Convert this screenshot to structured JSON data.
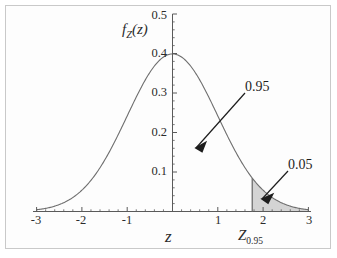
{
  "figure": {
    "background_color": "#ffffff",
    "frame_color": "#c9c9c9",
    "curve_color": "#6e6e6e",
    "axis_color": "#5a5a5a",
    "fill_color": "#d4d4d4",
    "annotation_color": "#1d1d1d"
  },
  "axes": {
    "y_axis_label": "f",
    "y_axis_label_sub": "Z",
    "y_axis_label_tail": "(z)",
    "x_axis_label": "z",
    "x_ticks": [
      "-3",
      "-2",
      "-1",
      "1",
      "2",
      "3"
    ],
    "x_tick_values": [
      -3,
      -2,
      -1,
      1,
      2,
      3
    ],
    "y_ticks": [
      "0.1",
      "0.2",
      "0.3",
      "0.4",
      "0.5"
    ],
    "y_tick_values": [
      0.1,
      0.2,
      0.3,
      0.4,
      0.5
    ]
  },
  "annotations": {
    "area_main_label": "0.95",
    "area_tail_label": "0.05",
    "critical_value_label": "Z",
    "critical_value_sub": "0.95"
  },
  "chart_data": {
    "type": "area",
    "title": "",
    "xlabel": "z",
    "ylabel": "f_Z(z)",
    "grid": false,
    "legend_position": "none",
    "xlim": [
      -3,
      3
    ],
    "ylim": [
      0,
      0.5
    ],
    "x_ticks": [
      -3,
      -2,
      -1,
      1,
      2,
      3
    ],
    "y_ticks": [
      0.1,
      0.2,
      0.3,
      0.4,
      0.5
    ],
    "series": [
      {
        "name": "standard normal pdf",
        "type": "line",
        "x": [
          -3.0,
          -2.8,
          -2.6,
          -2.4,
          -2.2,
          -2.0,
          -1.8,
          -1.6,
          -1.4,
          -1.2,
          -1.0,
          -0.8,
          -0.6,
          -0.4,
          -0.2,
          0.0,
          0.2,
          0.4,
          0.6,
          0.8,
          1.0,
          1.2,
          1.4,
          1.6,
          1.8,
          2.0,
          2.2,
          2.4,
          2.6,
          2.8,
          3.0
        ],
        "y": [
          0.0044,
          0.0079,
          0.0136,
          0.0224,
          0.0355,
          0.054,
          0.079,
          0.1109,
          0.1497,
          0.1942,
          0.242,
          0.2897,
          0.3332,
          0.3683,
          0.391,
          0.3989,
          0.391,
          0.3683,
          0.3332,
          0.2897,
          0.242,
          0.1942,
          0.1497,
          0.1109,
          0.079,
          0.054,
          0.0355,
          0.0224,
          0.0136,
          0.0079,
          0.0044
        ]
      }
    ],
    "shaded_region": {
      "label": "0.05",
      "from_x": 1.76,
      "to_x": 3.0,
      "area": 0.05,
      "fill": "#d4d4d4"
    },
    "unshaded_region": {
      "label": "0.95",
      "from_x": -3.0,
      "to_x": 1.76,
      "area": 0.95
    },
    "vertical_line_x": 1.76,
    "vertical_line_label": "Z_0.95",
    "peak": {
      "x": 0.0,
      "y": 0.3989
    }
  }
}
